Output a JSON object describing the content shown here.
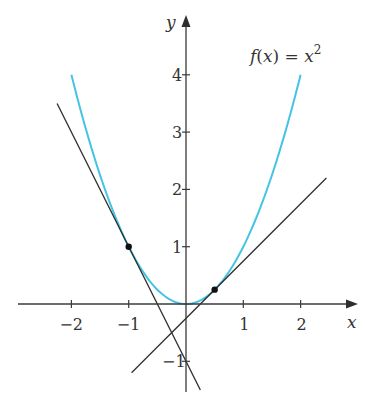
{
  "chart_data": {
    "type": "line",
    "title": "",
    "annotation": "f(x) = x²",
    "function_label": {
      "f": "f",
      "open": "(",
      "x": "x",
      "close": ")",
      "eq": " = ",
      "base": "x",
      "exp": "2"
    },
    "xlabel": "x",
    "ylabel": "y",
    "xlim": [
      -2.9,
      3.0
    ],
    "ylim": [
      -1.55,
      4.5
    ],
    "grid": false,
    "legend": "none",
    "x_ticks": [
      -2,
      -1,
      1,
      2
    ],
    "x_tick_labels": [
      "−2",
      "−1",
      "1",
      "2"
    ],
    "y_ticks": [
      -1,
      1,
      2,
      3,
      4
    ],
    "y_tick_labels": [
      "−1",
      "1",
      "2",
      "3",
      "4"
    ],
    "series": [
      {
        "name": "f(x) = x^2",
        "kind": "curve",
        "color": "#45c3e3",
        "x_range": [
          -2,
          2
        ],
        "formula": "x^2",
        "x": [
          -2,
          -1.5,
          -1,
          -0.5,
          0,
          0.5,
          1,
          1.5,
          2
        ],
        "y": [
          4,
          2.25,
          1,
          0.25,
          0,
          0.25,
          1,
          2.25,
          4
        ]
      },
      {
        "name": "tangent at x = -1",
        "kind": "line",
        "color": "#2e2e2e",
        "formula": "y = -2x - 1",
        "x": [
          -2.25,
          0.25
        ],
        "y": [
          3.5,
          -1.5
        ]
      },
      {
        "name": "tangent at x = 0.5",
        "kind": "line",
        "color": "#2e2e2e",
        "formula": "y = x - 0.25",
        "x": [
          -0.95,
          2.45
        ],
        "y": [
          -1.2,
          2.2
        ]
      }
    ],
    "points": [
      {
        "label": "tangency point 1",
        "x": -1,
        "y": 1
      },
      {
        "label": "tangency point 2",
        "x": 0.5,
        "y": 0.25
      }
    ]
  }
}
